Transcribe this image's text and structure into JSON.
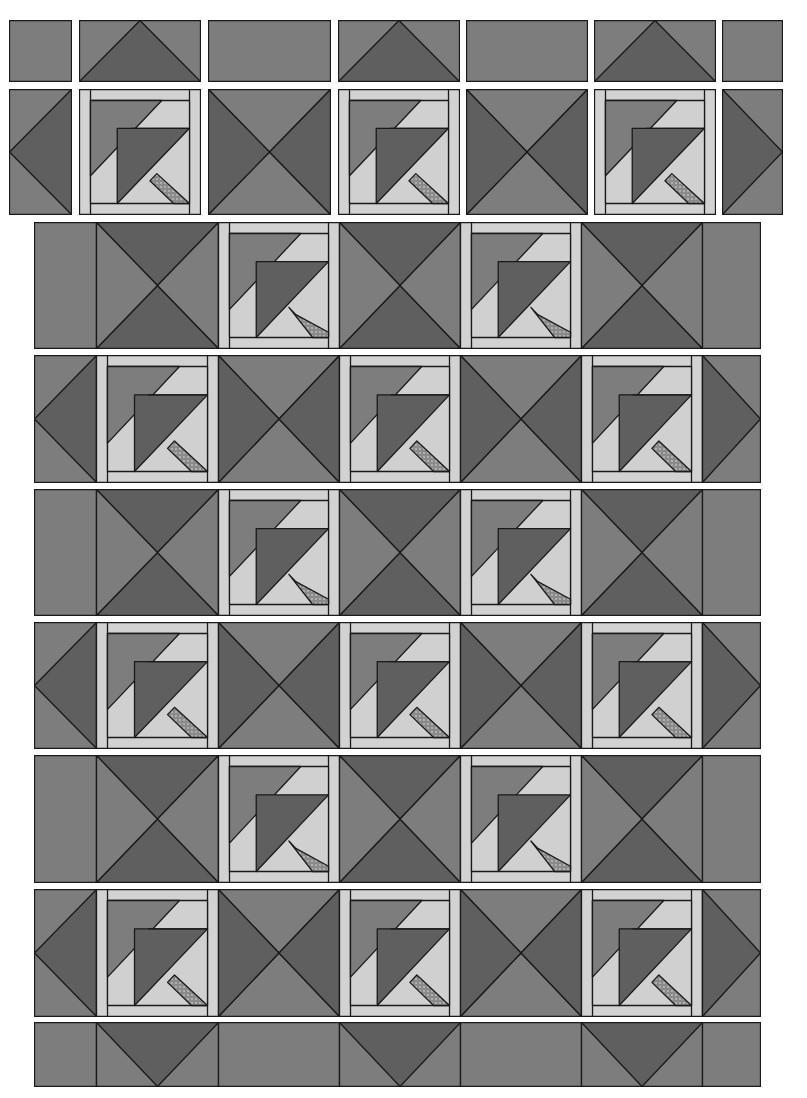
{
  "diagram": {
    "type": "quilt-layout",
    "colors": {
      "dark": "#5f5f5f",
      "medium": "#7d7d7d",
      "light": "#d0d0d0",
      "sashing": "#d2d2d2",
      "check": "#8a8a8a",
      "outline": "#1a1a1a",
      "background": "#ffffff"
    },
    "top_row": [
      {
        "x": 9,
        "w": 63,
        "kind": "plain"
      },
      {
        "x": 79,
        "w": 122,
        "kind": "flying-geese-up"
      },
      {
        "x": 208,
        "w": 123,
        "kind": "plain"
      },
      {
        "x": 338,
        "w": 122,
        "kind": "flying-geese-up"
      },
      {
        "x": 466,
        "w": 122,
        "kind": "plain"
      },
      {
        "x": 594,
        "w": 122,
        "kind": "flying-geese-up"
      },
      {
        "x": 722,
        "w": 61,
        "kind": "plain"
      }
    ],
    "second_row": [
      {
        "x": 9,
        "w": 63,
        "kind": "half-hourglass-left"
      },
      {
        "x": 79,
        "w": 122,
        "kind": "umbrella-block"
      },
      {
        "x": 208,
        "w": 123,
        "kind": "hourglass"
      },
      {
        "x": 338,
        "w": 122,
        "kind": "umbrella-block"
      },
      {
        "x": 466,
        "w": 122,
        "kind": "hourglass-alt"
      },
      {
        "x": 594,
        "w": 122,
        "kind": "umbrella-block"
      },
      {
        "x": 722,
        "w": 61,
        "kind": "half-hourglass-right"
      }
    ],
    "joined_rows": [
      {
        "y": 222,
        "h": 126,
        "pattern": "B"
      },
      {
        "y": 355,
        "h": 127,
        "pattern": "A"
      },
      {
        "y": 489,
        "h": 126,
        "pattern": "B"
      },
      {
        "y": 622,
        "h": 126,
        "pattern": "A"
      },
      {
        "y": 755,
        "h": 127,
        "pattern": "B"
      },
      {
        "y": 889,
        "h": 127,
        "pattern": "A"
      }
    ],
    "bottom_row": {
      "y": 1022,
      "h": 64,
      "kind": "flying-geese-down-border"
    },
    "joined_x": 34,
    "joined_w": 726
  }
}
